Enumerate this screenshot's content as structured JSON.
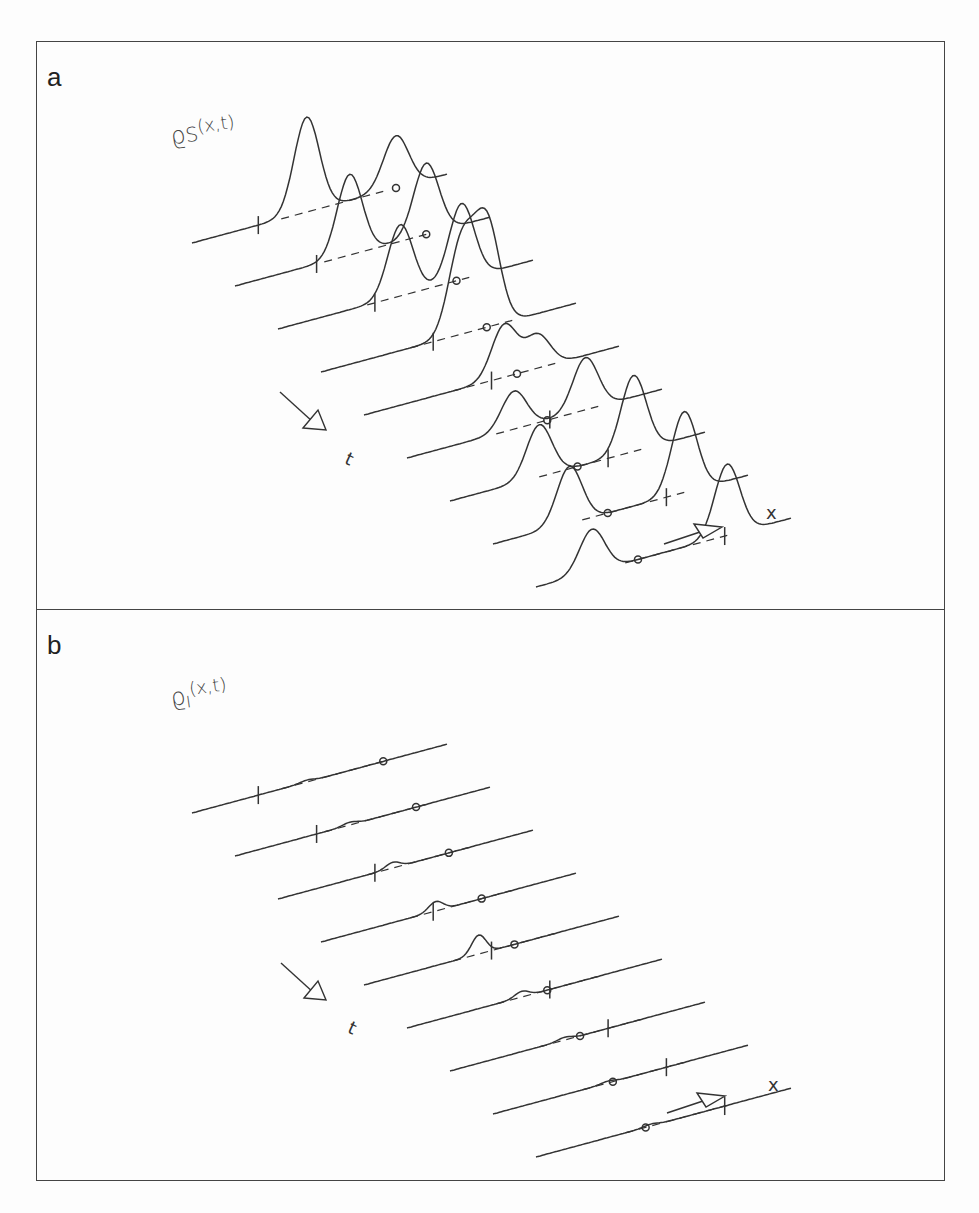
{
  "figure": {
    "panels": [
      {
        "id": "a",
        "label": "a",
        "quantity_symbol": "ϱ",
        "quantity_subscript": "S",
        "quantity_args": "(x,t)",
        "time_axis_symbol": "t",
        "space_axis_symbol": "x",
        "description": "Waterfall plot of density rho_S(x,t): nine time slices; a single peak splits into two moving peaks; circle and tick markers show positions along dashed guide lines"
      },
      {
        "id": "b",
        "label": "b",
        "quantity_symbol": "ϱ",
        "quantity_subscript": "I",
        "quantity_args": "(x,t)",
        "time_axis_symbol": "t",
        "space_axis_symbol": "x",
        "description": "Waterfall plot of density rho_I(x,t): nine nearly flat time slices with a small transient bump near the middle slices"
      }
    ]
  },
  "chart_data": [
    {
      "type": "line",
      "title": "a",
      "ylabel": "ϱS(x,t)",
      "xlabel": "x",
      "zlabel": "t",
      "slices": 9,
      "grid": false,
      "legend": "none",
      "series_shape": [
        {
          "slice": 1,
          "peaks": [
            {
              "pos": 0.45,
              "height": 1.0
            },
            {
              "pos": 0.8,
              "height": 0.55
            }
          ]
        },
        {
          "slice": 2,
          "peaks": [
            {
              "pos": 0.45,
              "height": 0.85
            },
            {
              "pos": 0.75,
              "height": 0.75
            }
          ]
        },
        {
          "slice": 3,
          "peaks": [
            {
              "pos": 0.48,
              "height": 0.75
            },
            {
              "pos": 0.72,
              "height": 0.8
            }
          ]
        },
        {
          "slice": 4,
          "peaks": [
            {
              "pos": 0.55,
              "height": 0.95
            },
            {
              "pos": 0.65,
              "height": 1.1
            }
          ]
        },
        {
          "slice": 5,
          "peaks": [
            {
              "pos": 0.55,
              "height": 0.55
            },
            {
              "pos": 0.68,
              "height": 0.35
            }
          ]
        },
        {
          "slice": 6,
          "peaks": [
            {
              "pos": 0.42,
              "height": 0.4
            },
            {
              "pos": 0.7,
              "height": 0.55
            }
          ]
        },
        {
          "slice": 7,
          "peaks": [
            {
              "pos": 0.35,
              "height": 0.55
            },
            {
              "pos": 0.72,
              "height": 0.8
            }
          ]
        },
        {
          "slice": 8,
          "peaks": [
            {
              "pos": 0.3,
              "height": 0.6
            },
            {
              "pos": 0.75,
              "height": 0.85
            }
          ]
        },
        {
          "slice": 9,
          "peaks": [
            {
              "pos": 0.22,
              "height": 0.45
            },
            {
              "pos": 0.75,
              "height": 0.75
            }
          ]
        }
      ]
    },
    {
      "type": "line",
      "title": "b",
      "ylabel": "ϱI(x,t)",
      "xlabel": "x",
      "zlabel": "t",
      "slices": 9,
      "grid": false,
      "legend": "none",
      "series_shape": [
        {
          "slice": 1,
          "bump_height": 0.02
        },
        {
          "slice": 2,
          "bump_height": 0.03
        },
        {
          "slice": 3,
          "bump_height": 0.06
        },
        {
          "slice": 4,
          "bump_height": 0.1
        },
        {
          "slice": 5,
          "bump_height": 0.2
        },
        {
          "slice": 6,
          "bump_height": 0.06
        },
        {
          "slice": 7,
          "bump_height": 0.03
        },
        {
          "slice": 8,
          "bump_height": 0.02
        },
        {
          "slice": 9,
          "bump_height": 0.02
        }
      ]
    }
  ]
}
